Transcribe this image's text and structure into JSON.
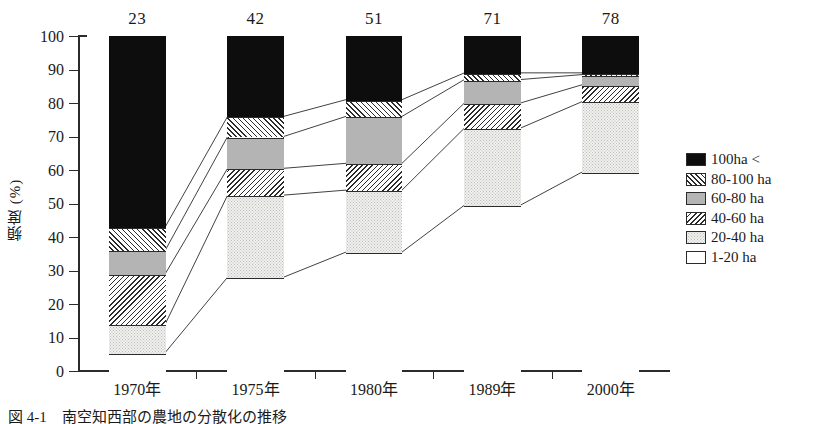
{
  "chart_data": {
    "type": "bar",
    "subtype": "stacked-percentage",
    "title": "",
    "xlabel": "",
    "ylabel": "頻度 (%)",
    "ylim": [
      0,
      100
    ],
    "yticks": [
      0,
      10,
      20,
      30,
      40,
      50,
      60,
      70,
      80,
      90,
      100
    ],
    "grid": false,
    "legend_position": "right",
    "categories": [
      "1970年",
      "1975年",
      "1980年",
      "1989年",
      "2000年"
    ],
    "sample_sizes": [
      23,
      42,
      51,
      71,
      78
    ],
    "series": [
      {
        "name": "1-20 ha",
        "pattern": "white",
        "values": [
          5.5,
          28.0,
          35.5,
          49.5,
          59.5
        ]
      },
      {
        "name": "20-40 ha",
        "pattern": "dots",
        "values": [
          8.5,
          24.5,
          18.5,
          23.0,
          21.0
        ]
      },
      {
        "name": "40-60 ha",
        "pattern": "hatch-back",
        "values": [
          15.0,
          8.0,
          8.0,
          7.5,
          5.0
        ]
      },
      {
        "name": "60-80 ha",
        "pattern": "gray",
        "values": [
          7.0,
          9.5,
          14.0,
          7.0,
          3.0
        ]
      },
      {
        "name": "80-100 ha",
        "pattern": "hatch-fwd",
        "values": [
          7.0,
          6.0,
          5.0,
          2.0,
          0.5
        ]
      },
      {
        "name": "100ha <",
        "pattern": "black",
        "values": [
          57.0,
          24.0,
          19.0,
          11.0,
          11.0
        ]
      }
    ],
    "cumulative_tops": [
      [
        5.5,
        14.0,
        29.0,
        36.0,
        43.0,
        100.0
      ],
      [
        28.0,
        52.5,
        60.5,
        70.0,
        76.0,
        100.0
      ],
      [
        35.5,
        54.0,
        62.0,
        76.0,
        81.0,
        100.0
      ],
      [
        49.5,
        72.5,
        80.0,
        87.0,
        89.0,
        100.0
      ],
      [
        59.5,
        80.5,
        85.5,
        88.5,
        89.0,
        100.0
      ]
    ]
  },
  "axis": {
    "y_tick_labels": [
      "100",
      "90",
      "80",
      "70",
      "60",
      "50",
      "40",
      "30",
      "20",
      "10",
      "0"
    ],
    "y_axis_title": "頻度 (%)",
    "x_tick_labels": [
      "1970年",
      "1975年",
      "1980年",
      "1989年",
      "2000年"
    ]
  },
  "top_counts": [
    "23",
    "42",
    "51",
    "71",
    "78"
  ],
  "legend": {
    "items": [
      {
        "label": "100ha <",
        "pattern": "black"
      },
      {
        "label": "80-100 ha",
        "pattern": "hatch-fwd"
      },
      {
        "label": "60-80 ha",
        "pattern": "gray"
      },
      {
        "label": "40-60 ha",
        "pattern": "hatch-back"
      },
      {
        "label": "20-40 ha",
        "pattern": "dots"
      },
      {
        "label": "1-20 ha",
        "pattern": "white"
      }
    ]
  },
  "caption": "図 4-1　南空知西部の農地の分散化の推移",
  "colors": {
    "ink": "#2b2b2b",
    "black_fill": "#0d0d0d",
    "gray_fill": "#b4b4b4",
    "dots_fill": "#f0f0ee",
    "white_fill": "#ffffff",
    "background": "#ffffff"
  }
}
